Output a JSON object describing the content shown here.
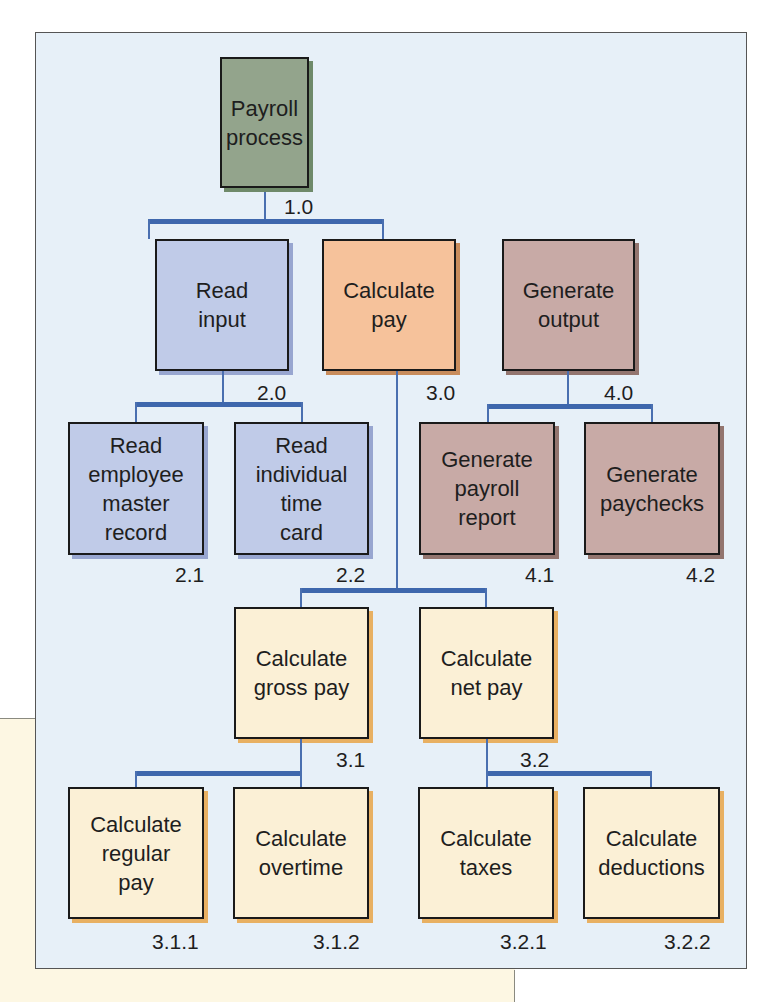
{
  "diagram": {
    "type": "hierarchy-chart",
    "colors": {
      "frame_bg": "#e7f0f8",
      "connector": "#3e67ad",
      "root": "#93a48c",
      "read": "#c0cbe8",
      "calculate_top": "#f6c29b",
      "generate": "#c8aaa6",
      "calculate_sub": "#fbf0d6"
    },
    "nodes": {
      "root": {
        "label": "Payroll\nprocess",
        "number": "1.0"
      },
      "read_input": {
        "label": "Read\ninput",
        "number": "2.0"
      },
      "calculate_pay": {
        "label": "Calculate\npay",
        "number": "3.0"
      },
      "generate_output": {
        "label": "Generate\noutput",
        "number": "4.0"
      },
      "read_employee_master": {
        "label": "Read\nemployee\nmaster\nrecord",
        "number": "2.1"
      },
      "read_time_card": {
        "label": "Read\nindividual\ntime\ncard",
        "number": "2.2"
      },
      "generate_report": {
        "label": "Generate\npayroll\nreport",
        "number": "4.1"
      },
      "generate_paychecks": {
        "label": "Generate\npaychecks",
        "number": "4.2"
      },
      "calculate_gross": {
        "label": "Calculate\ngross pay",
        "number": "3.1"
      },
      "calculate_net": {
        "label": "Calculate\nnet pay",
        "number": "3.2"
      },
      "calculate_regular": {
        "label": "Calculate\nregular\npay",
        "number": "3.1.1"
      },
      "calculate_overtime": {
        "label": "Calculate\novertime",
        "number": "3.1.2"
      },
      "calculate_taxes": {
        "label": "Calculate\ntaxes",
        "number": "3.2.1"
      },
      "calculate_deductions": {
        "label": "Calculate\ndeductions",
        "number": "3.2.2"
      }
    }
  }
}
